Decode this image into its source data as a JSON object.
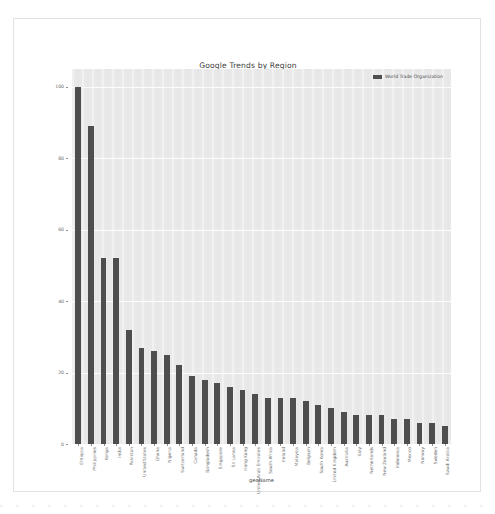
{
  "chart_data": {
    "type": "bar",
    "title": "Google Trends by Region",
    "xlabel": "geoName",
    "ylabel": "",
    "ylim": [
      0,
      105
    ],
    "grid": true,
    "legend_position": "top-right",
    "series": [
      {
        "name": "World Trade Organization",
        "color": "#4e4e4e",
        "values": [
          100,
          89,
          52,
          52,
          32,
          27,
          26,
          25,
          22,
          19,
          18,
          17,
          16,
          15,
          14,
          13,
          13,
          13,
          12,
          11,
          10,
          9,
          8,
          8,
          8,
          7,
          7,
          6,
          6,
          5
        ]
      }
    ],
    "categories": [
      "Ethiopia",
      "Philippines",
      "Kenya",
      "India",
      "Pakistan",
      "United States",
      "Ghana",
      "Nigeria",
      "Switzerland",
      "Canada",
      "Bangladesh",
      "Singapore",
      "Sri Lanka",
      "Hong Kong",
      "United Arab Emirates",
      "South Africa",
      "Ireland",
      "Malaysia",
      "Belgium",
      "South Korea",
      "United Kingdom",
      "Australia",
      "Italy",
      "Netherlands",
      "New Zealand",
      "Indonesia",
      "Mexico",
      "Norway",
      "Sweden",
      "Saudi Arabia"
    ],
    "yticks": [
      0,
      20,
      40,
      60,
      80,
      100
    ]
  },
  "legend": {
    "label": "World Trade Organization"
  },
  "colors": {
    "bar": "#4e4e4e",
    "plot_background": "#e9e9e9",
    "gridline": "#fdfdfd",
    "axis_text": "#6d6d6d",
    "title_text": "#3b3b3b"
  }
}
